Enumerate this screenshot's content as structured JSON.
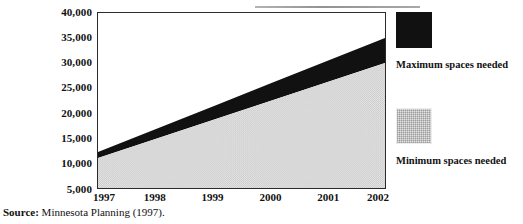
{
  "chart_data": {
    "type": "area",
    "title": "",
    "subtitle": "",
    "xlabel": "",
    "ylabel": "",
    "categories": [
      "1997",
      "1998",
      "1999",
      "2000",
      "2001",
      "2002"
    ],
    "x": [
      1997,
      1998,
      1999,
      2000,
      2001,
      2002
    ],
    "series": [
      {
        "name": "Minimum spaces needed",
        "color": "#e2e2e2",
        "values": [
          11000,
          14800,
          18600,
          22400,
          26200,
          30000
        ]
      },
      {
        "name": "Maximum spaces needed",
        "color": "#111111",
        "values": [
          12200,
          16760,
          21320,
          25880,
          30440,
          35000
        ]
      }
    ],
    "ylim": [
      5000,
      40000
    ],
    "xlim": [
      1997,
      2002
    ],
    "ytick_labels": [
      "40,000",
      "35,000",
      "30,000",
      "25,000",
      "20,000",
      "15,000",
      "10,000",
      "5,000"
    ],
    "ytick_values": [
      40000,
      35000,
      30000,
      25000,
      20000,
      15000,
      10000,
      5000
    ],
    "grid": false,
    "legend_position": "right",
    "stacked_display": "band-between-min-and-max"
  },
  "legend": {
    "entries": [
      {
        "label": "Maximum spaces needed",
        "swatch": "black-swatch"
      },
      {
        "label": "Minimum spaces needed",
        "swatch": "gray-swatch"
      }
    ]
  },
  "source": {
    "prefix": "Source:",
    "text": " Minnesota Planning (1997)."
  }
}
